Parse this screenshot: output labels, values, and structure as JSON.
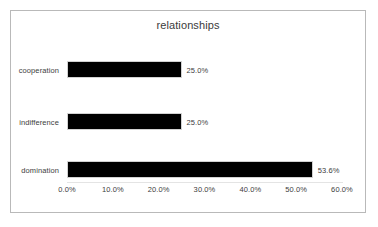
{
  "chart_data": {
    "type": "bar",
    "orientation": "horizontal",
    "title": "relationships",
    "xlabel": "",
    "ylabel": "",
    "categories": [
      "cooperation",
      "indifference",
      "domination"
    ],
    "values": [
      25.0,
      25.0,
      53.6
    ],
    "data_labels": [
      "25.0%",
      "25.0%",
      "53.6%"
    ],
    "xlim": [
      0,
      60
    ],
    "xticks": [
      0,
      10,
      20,
      30,
      40,
      50,
      60
    ],
    "xtick_labels": [
      "0.0%",
      "10.0%",
      "20.0%",
      "30.0%",
      "40.0%",
      "50.0%",
      "60.0%"
    ],
    "grid": false,
    "legend": false,
    "bar_color": "#000000",
    "bar_border_color": "#d2d2d2",
    "text_color": "#3d3d3d",
    "frame_color": "#b9b9b9",
    "background_color": "#ffffff"
  }
}
